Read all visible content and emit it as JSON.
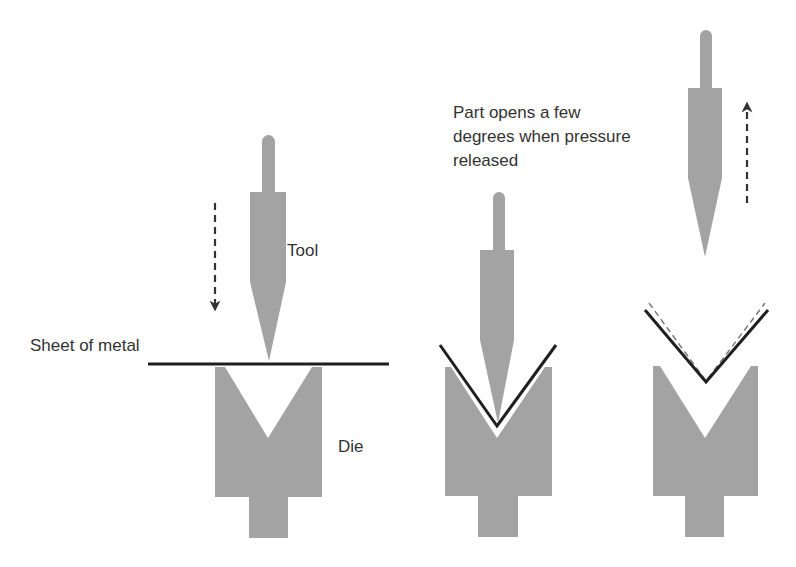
{
  "colors": {
    "part_fill": "#a3a3a3",
    "sheet": "#1f1f1f",
    "arrow": "#333333",
    "text": "#333333",
    "background": "#ffffff"
  },
  "labels": {
    "sheet": "Sheet of metal",
    "tool": "Tool",
    "die": "Die",
    "springback_note": [
      "Part opens a few",
      "degrees when pressure",
      "released"
    ]
  },
  "stages": [
    {
      "name": "before-bending",
      "tool_direction": "down"
    },
    {
      "name": "bending",
      "tool_direction": "none"
    },
    {
      "name": "after-release",
      "tool_direction": "up"
    }
  ]
}
